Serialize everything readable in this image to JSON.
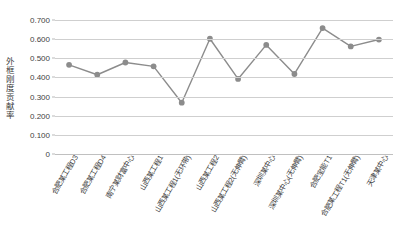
{
  "chart_data": {
    "type": "line",
    "title": "",
    "xlabel": "",
    "ylabel": "外框刚度贡献率",
    "ylim": [
      0,
      0.7
    ],
    "y_ticks": [
      "0",
      "0.100",
      "0.200",
      "0.300",
      "0.400",
      "0.500",
      "0.600",
      "0.700"
    ],
    "y_tick_values": [
      0,
      0.1,
      0.2,
      0.3,
      0.4,
      0.5,
      0.6,
      0.7
    ],
    "grid": true,
    "legend": "none",
    "marker": "circle",
    "series_color": "#8c8c8c",
    "categories": [
      "合肥某工程D3",
      "合肥某工程D4",
      "南宁某财富中心",
      "山西某工程1",
      "山西某工程1(无环带)",
      "山西某工程2",
      "山西某工程2(无伸臂)",
      "深圳某中心",
      "深圳某中心(无伸臂)",
      "合肥宝能T1",
      "合肥某工程T1(无伸臂)",
      "天津某中心"
    ],
    "values": [
      0.466,
      0.414,
      0.478,
      0.458,
      0.268,
      0.602,
      0.392,
      0.57,
      0.418,
      0.658,
      0.562,
      0.598
    ]
  }
}
